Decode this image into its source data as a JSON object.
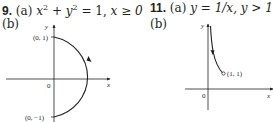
{
  "problems": [
    {
      "number": "9.",
      "part_a_label": "(a)",
      "equation_lhs": "x",
      "equation_mid": " + y",
      "equation_rhs": " = 1, ",
      "condition": "x ≥ 0",
      "part_b_label": "(b)",
      "graph": {
        "x_axis_label": "x",
        "y_axis_label": "y",
        "origin_label": "0",
        "point_top": "(0, 1)",
        "point_bottom": "(0, −1)"
      }
    },
    {
      "number": "11.",
      "part_a_label": "(a)",
      "equation": "y = 1/x, y > 1",
      "part_b_label": "(b)",
      "graph": {
        "x_axis_label": "x",
        "y_axis_label": "y",
        "origin_label": "0",
        "point_end": "(1, 1)"
      }
    }
  ],
  "colors": {
    "ink": "#231f20",
    "background": "#ffffff"
  }
}
